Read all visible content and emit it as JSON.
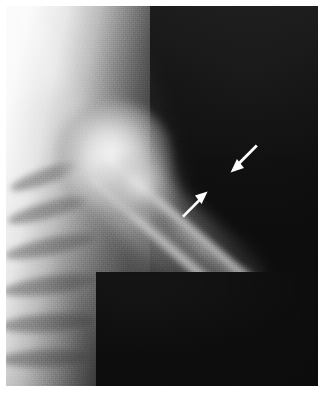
{
  "figure": {
    "modality": "x-ray-radiograph",
    "body_region": "left shoulder and proximal humerus",
    "projection": "anteroposterior",
    "caption": "",
    "background_color": "#0c0c0c",
    "film_border_color": "#ffffff",
    "width_px": 325,
    "height_px": 393
  },
  "anatomy": {
    "structures": [
      {
        "name": "humeral-head",
        "label": "Humeral head",
        "brightness": "bright"
      },
      {
        "name": "greater-tuberosity",
        "label": "Greater tuberosity",
        "brightness": "bright"
      },
      {
        "name": "humeral-shaft",
        "label": "Humeral shaft",
        "brightness": "mid-grey",
        "orientation_deg": 41
      },
      {
        "name": "thorax-ribcage",
        "label": "Ribcage / chest wall",
        "brightness": "white"
      },
      {
        "name": "soft-tissue-envelope",
        "label": "Soft tissue",
        "brightness": "grey"
      }
    ],
    "ribs": [
      {
        "name": "rib-1",
        "x": 2,
        "y": 163,
        "w": 74,
        "h": 15,
        "rot": -20
      },
      {
        "name": "rib-2",
        "x": 0,
        "y": 196,
        "w": 84,
        "h": 16,
        "rot": -16
      },
      {
        "name": "rib-3",
        "x": -2,
        "y": 232,
        "w": 92,
        "h": 17,
        "rot": -12
      },
      {
        "name": "rib-4",
        "x": -4,
        "y": 270,
        "w": 98,
        "h": 18,
        "rot": -8
      },
      {
        "name": "rib-5",
        "x": -6,
        "y": 308,
        "w": 96,
        "h": 18,
        "rot": -4
      },
      {
        "name": "rib-6",
        "x": -6,
        "y": 344,
        "w": 88,
        "h": 17,
        "rot": -2
      }
    ]
  },
  "annotations": {
    "arrow_color": "#ffffff",
    "arrows": [
      {
        "name": "arrow-upper-right",
        "label": "Arrow marking lateral cortical lesion",
        "x": 228,
        "y": 142,
        "width": 32,
        "height": 34,
        "direction": "down-left",
        "points_at": "lateral humeral cortex"
      },
      {
        "name": "arrow-lower-left",
        "label": "Arrow marking medial cortical lesion",
        "x": 176,
        "y": 189,
        "width": 38,
        "height": 30,
        "direction": "up-right",
        "points_at": "medial humeral cortex"
      }
    ]
  },
  "collimation": {
    "name": "collimation-mask",
    "label": "Collimator shadow",
    "x": 96,
    "y": 272,
    "width": 222,
    "height": 114,
    "color": "#0c0c0c"
  }
}
